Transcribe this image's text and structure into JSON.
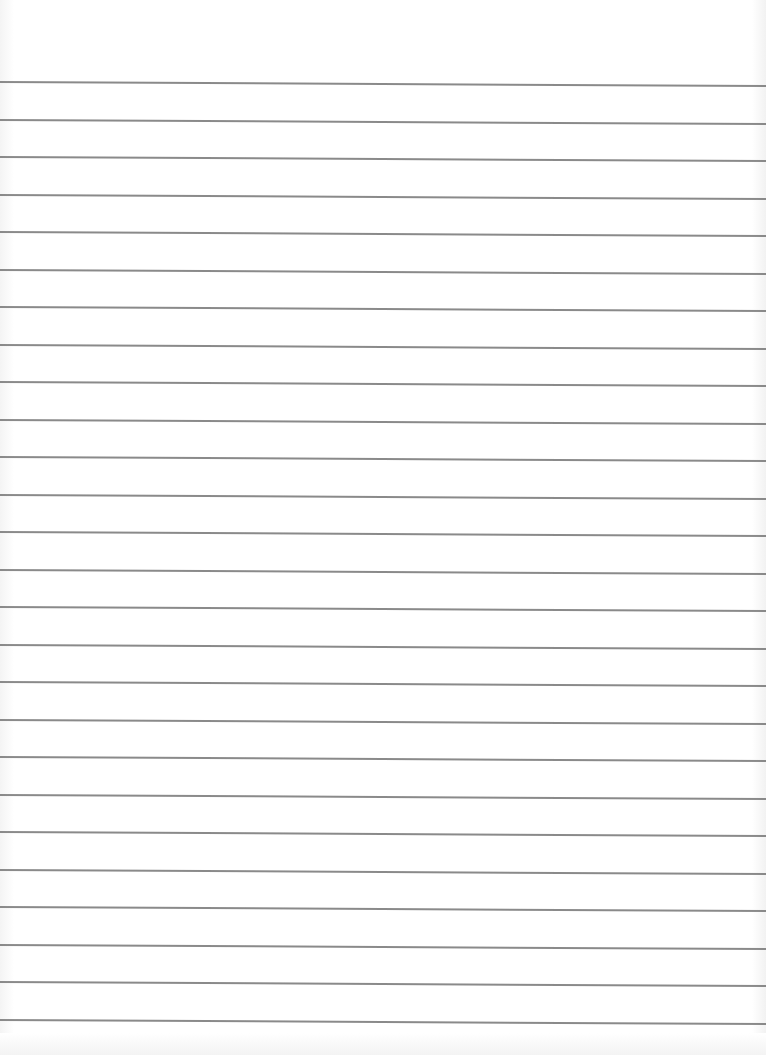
{
  "page": {
    "type": "lined-paper",
    "background_color": "#ffffff",
    "line_color": "#7d7d7d",
    "line_count": 26,
    "first_line_y": 81,
    "line_spacing": 37.5
  }
}
